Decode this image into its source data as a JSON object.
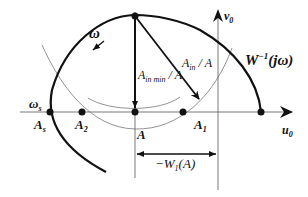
{
  "diagram": {
    "type": "describing-function-nyquist-plot",
    "axes": {
      "horizontal_label_base": "u",
      "horizontal_label_sub": "0",
      "vertical_label_base": "v",
      "vertical_label_sub": "0"
    },
    "curve_label": {
      "base": "W",
      "sup": "−1",
      "arg": "(jω)"
    },
    "omega_label": "ω",
    "omega_s_label": {
      "base": "ω",
      "sub": "s"
    },
    "points": [
      {
        "base": "A",
        "sub": "s"
      },
      {
        "base": "A",
        "sub": "2"
      },
      {
        "base": "A",
        "sub": ""
      },
      {
        "base": "A",
        "sub": "1"
      }
    ],
    "vector_labels": {
      "vertical": {
        "base": "A",
        "sub": "in min",
        "suffix": " / A"
      },
      "diagonal": {
        "base": "A",
        "sub": "in",
        "suffix": " / A"
      }
    },
    "distance_label": {
      "prefix": "−W",
      "sub": "1",
      "arg": "(A)"
    },
    "colors": {
      "ink": "#111111",
      "thin": "#777777"
    }
  }
}
